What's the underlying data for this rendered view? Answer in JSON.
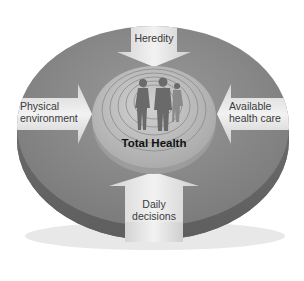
{
  "diagram": {
    "center_label": "Total Health",
    "factors": [
      {
        "id": "heredity",
        "label": "Heredity",
        "direction": "down",
        "position": "top"
      },
      {
        "id": "physical-environment",
        "label_line1": "Physical",
        "label_line2": "environment",
        "direction": "right",
        "position": "left"
      },
      {
        "id": "available-health-care",
        "label_line1": "Available",
        "label_line2": "health care",
        "direction": "left",
        "position": "right"
      },
      {
        "id": "daily-decisions",
        "label_line1": "Daily",
        "label_line2": "decisions",
        "direction": "up",
        "position": "bottom"
      }
    ],
    "colors": {
      "disc_top": "#8a8a8a",
      "disc_side": "#6e6e6e",
      "inner_disc": "#c4c4c4",
      "arrow_fill": "#e6e6e6",
      "text": "#3a3a3a"
    }
  }
}
